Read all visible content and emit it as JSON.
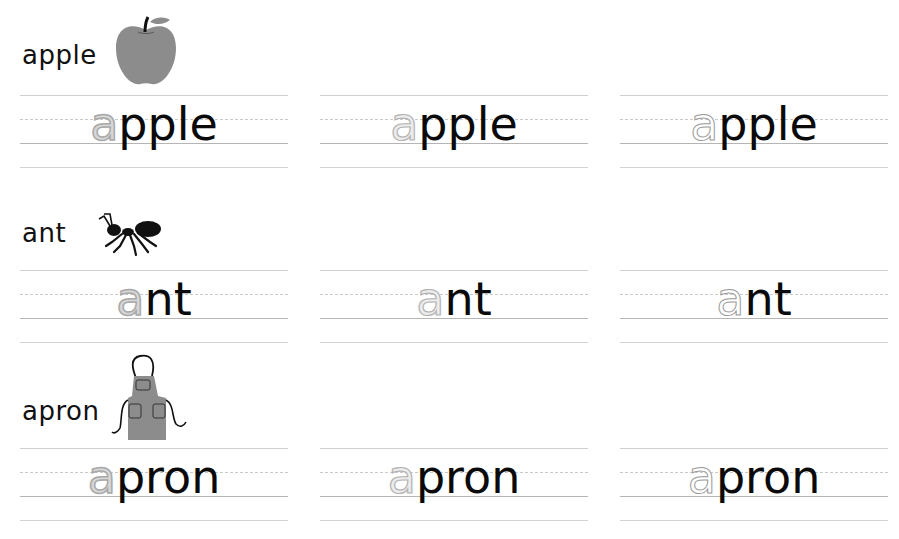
{
  "worksheet": {
    "rows": [
      {
        "label": "apple",
        "picture": "apple-icon",
        "trace_letter": "a",
        "rest": "pple",
        "cells": [
          {
            "style": "filled",
            "trace": "a",
            "rest": "pple"
          },
          {
            "style": "light",
            "trace": "a",
            "rest": "pple"
          },
          {
            "style": "outline",
            "trace": "a",
            "rest": "pple"
          }
        ]
      },
      {
        "label": "ant",
        "picture": "ant-icon",
        "trace_letter": "a",
        "rest": "nt",
        "cells": [
          {
            "style": "filled",
            "trace": "a",
            "rest": "nt"
          },
          {
            "style": "light",
            "trace": "a",
            "rest": "nt"
          },
          {
            "style": "outline",
            "trace": "a",
            "rest": "nt"
          }
        ]
      },
      {
        "label": "apron",
        "picture": "apron-icon",
        "trace_letter": "a",
        "rest": "pron",
        "cells": [
          {
            "style": "filled",
            "trace": "a",
            "rest": "pron"
          },
          {
            "style": "light",
            "trace": "a",
            "rest": "pron"
          },
          {
            "style": "outline",
            "trace": "a",
            "rest": "pron"
          }
        ]
      }
    ]
  },
  "colors": {
    "ink": "#0a0a0a",
    "picture_gray": "#8c8c8c",
    "guide_line": "#c9c9c9"
  }
}
